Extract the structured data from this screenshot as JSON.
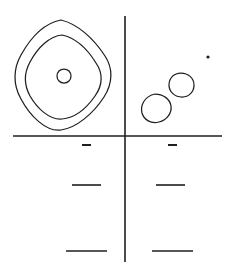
{
  "figure": {
    "title": "",
    "width": 233,
    "height": 276,
    "background_color": "#ffffff",
    "stroke_color": "#1f1f1f",
    "line_style": "hand-drawn"
  },
  "chart_data": {
    "type": "scatter",
    "title": "",
    "subtitle": "",
    "xlabel": "",
    "ylabel": "",
    "grid": false,
    "legend": null,
    "axes": {
      "horizontal_axis": {
        "label": "",
        "y": 136,
        "x_start": 13,
        "x_end": 222,
        "stroke_width": 1.6,
        "color": "#1f1f1f"
      },
      "vertical_axis": {
        "label": "",
        "x": 125,
        "y_start": 16,
        "y_end": 262,
        "stroke_width": 1.6,
        "color": "#1f1f1f"
      },
      "origin": {
        "x": 125,
        "y": 136
      }
    },
    "contours": [
      {
        "name": "outer-contour",
        "quadrant": "upper-left",
        "shape": "rounded-diamond",
        "center": {
          "x": 62,
          "y": 74
        },
        "radius_x": 48,
        "radius_y": 55,
        "level": 1
      },
      {
        "name": "middle-contour",
        "quadrant": "upper-left",
        "shape": "rounded-diamond",
        "center": {
          "x": 63,
          "y": 76
        },
        "radius_x": 37,
        "radius_y": 42,
        "level": 2
      },
      {
        "name": "inner-contour",
        "quadrant": "upper-left",
        "shape": "rounded-diamond",
        "center": {
          "x": 64,
          "y": 76
        },
        "radius_x": 7,
        "radius_y": 7,
        "level": 3
      }
    ],
    "blobs": [
      {
        "name": "blob-lower",
        "quadrant": "upper-right",
        "shape": "rounded-square",
        "center": {
          "x": 156,
          "y": 108
        },
        "radius_x": 15,
        "radius_y": 14
      },
      {
        "name": "blob-upper",
        "quadrant": "upper-right",
        "shape": "rounded-square",
        "center": {
          "x": 181,
          "y": 85
        },
        "radius_x": 13,
        "radius_y": 12
      }
    ],
    "points": [
      {
        "name": "speck",
        "quadrant": "upper-right",
        "x": 208,
        "y": 57,
        "size": 2.4
      }
    ],
    "dashes": [
      {
        "name": "dash-upper-left",
        "row": "upper",
        "side": "left",
        "x_start": 82,
        "x_end": 91,
        "y": 145,
        "width": 9,
        "stroke_width": 2.0
      },
      {
        "name": "dash-upper-right",
        "row": "upper",
        "side": "right",
        "x_start": 168,
        "x_end": 177,
        "y": 145,
        "width": 9,
        "stroke_width": 2.0
      },
      {
        "name": "dash-middle-left",
        "row": "middle",
        "side": "left",
        "x_start": 72,
        "x_end": 101,
        "y": 185,
        "width": 29,
        "stroke_width": 1.6
      },
      {
        "name": "dash-middle-right",
        "row": "middle",
        "side": "right",
        "x_start": 156,
        "x_end": 185,
        "y": 185,
        "width": 29,
        "stroke_width": 1.6
      },
      {
        "name": "dash-lower-left",
        "row": "lower",
        "side": "left",
        "x_start": 66,
        "x_end": 107,
        "y": 251,
        "width": 41,
        "stroke_width": 1.6
      },
      {
        "name": "dash-lower-right",
        "row": "lower",
        "side": "right",
        "x_start": 152,
        "x_end": 193,
        "y": 251,
        "width": 41,
        "stroke_width": 1.6
      }
    ]
  }
}
